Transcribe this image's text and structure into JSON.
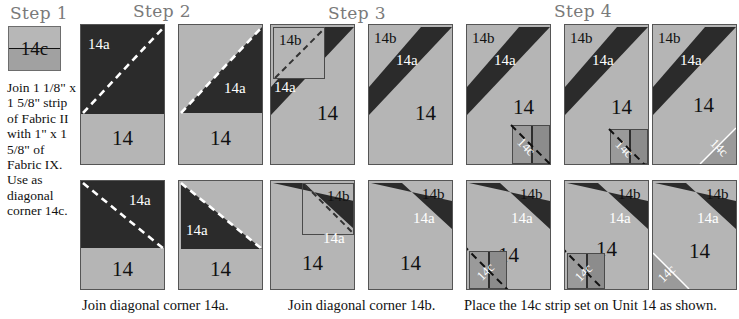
{
  "headings": [
    {
      "label": "Step 1"
    },
    {
      "label": "Step 2"
    },
    {
      "label": "Step 3"
    },
    {
      "label": "Step 4"
    }
  ],
  "step1": {
    "swatch_label": "14c",
    "instruction": "Join 1 1/8\" x 1 5/8\" strip of Fabric II with 1\" x 1 5/8\" of Fabric IX. Use as diagonal corner 14c."
  },
  "labels": {
    "unit": "14",
    "corner_a": "14a",
    "corner_b": "14b",
    "corner_c": "14c"
  },
  "captions": [
    {
      "text": "Join diagonal corner 14a."
    },
    {
      "text": "Join diagonal corner 14b."
    },
    {
      "text": "Place the 14c strip set on Unit 14 as shown."
    }
  ],
  "colors": {
    "dark_fabric": "#2b2b2b",
    "light_fabric": "#b5b5b5",
    "patch_light": "#9a9a9a",
    "patch_dark": "#8c8c8c",
    "stitch_line_light": "#ffffff",
    "stitch_line_dark": "#111111",
    "heading": "#7a7a7a",
    "background": "#ffffff"
  }
}
